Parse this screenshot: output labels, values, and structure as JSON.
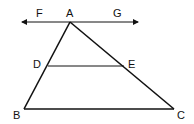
{
  "diagram": {
    "title": "",
    "points": {
      "A": {
        "label": "A",
        "x": 70,
        "y": 22
      },
      "B": {
        "label": "B",
        "x": 24,
        "y": 109
      },
      "C": {
        "label": "C",
        "x": 174,
        "y": 109
      },
      "D": {
        "label": "D",
        "x": 48,
        "y": 66
      },
      "E": {
        "label": "E",
        "x": 124,
        "y": 66
      },
      "F": {
        "label": "F"
      },
      "G": {
        "label": "G"
      }
    },
    "segments": [
      "AB",
      "AC",
      "BC",
      "DE"
    ],
    "lines": [
      "FG (through A, parallel to BC)"
    ],
    "colors": {
      "stroke": "#111111",
      "background": "#ffffff"
    }
  }
}
